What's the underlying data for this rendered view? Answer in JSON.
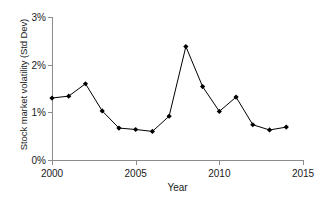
{
  "chart_data": {
    "type": "line",
    "title": "",
    "xlabel": "Year",
    "ylabel": "Stock market volatility (Std Dev)",
    "x": [
      2000,
      2001,
      2002,
      2003,
      2004,
      2005,
      2006,
      2007,
      2008,
      2009,
      2010,
      2011,
      2012,
      2013,
      2014
    ],
    "values": [
      1.3,
      1.34,
      1.6,
      1.03,
      0.67,
      0.64,
      0.6,
      0.92,
      2.38,
      1.54,
      1.02,
      1.32,
      0.74,
      0.63,
      0.69
    ],
    "series": [
      {
        "name": "Stock market volatility (Std Dev)",
        "values": [
          1.3,
          1.34,
          1.6,
          1.03,
          0.67,
          0.64,
          0.6,
          0.92,
          2.38,
          1.54,
          1.02,
          1.32,
          0.74,
          0.63,
          0.69
        ]
      }
    ],
    "xlim": [
      2000,
      2015
    ],
    "ylim": [
      0,
      3
    ],
    "xticks": [
      2000,
      2005,
      2010,
      2015
    ],
    "xtick_labels": [
      "2000",
      "2005",
      "2010",
      "2015"
    ],
    "yticks": [
      0,
      1,
      2,
      3
    ],
    "ytick_labels": [
      "0%",
      "1%",
      "2%",
      "3%"
    ],
    "grid": false,
    "legend": false,
    "legend_position": "none",
    "marker": "filled-diamond",
    "line_color": "#000000",
    "marker_color": "#000000",
    "axis_color": "#8c8c8c",
    "background_color": "#ffffff",
    "annotations": []
  }
}
